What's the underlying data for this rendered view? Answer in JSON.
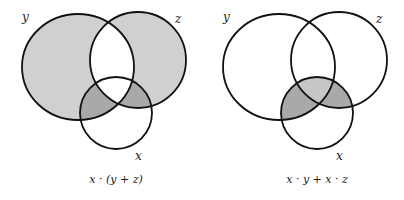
{
  "colors": {
    "background": "#ffffff",
    "stroke": "#111111",
    "light_shade": "#d0d0d0",
    "dark_shade": "#a9a9a9",
    "mid_shade": "#c6c6c6"
  },
  "diagrams": [
    {
      "labels": {
        "y": "y",
        "z": "z",
        "x": "x"
      },
      "caption": "x · (y + z)"
    },
    {
      "labels": {
        "y": "y",
        "z": "z",
        "x": "x"
      },
      "caption": "x · y + x · z"
    }
  ]
}
